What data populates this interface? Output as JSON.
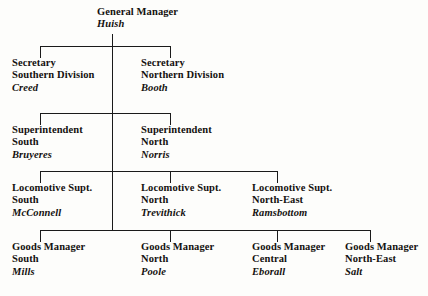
{
  "chart": {
    "line_color": "#1a1a1a",
    "background_color": "#fdfdfb",
    "text_color": "#14110f"
  },
  "nodes": {
    "general_manager": {
      "role": "General Manager",
      "region": "",
      "person": "Huish"
    },
    "secretary_south": {
      "role": "Secretary",
      "region": "Southern Division",
      "person": "Creed"
    },
    "secretary_north": {
      "role": "Secretary",
      "region": "Northern Division",
      "person": "Booth"
    },
    "superintendent_south": {
      "role": "Superintendent",
      "region": "South",
      "person": "Bruyeres"
    },
    "superintendent_north": {
      "role": "Superintendent",
      "region": "North",
      "person": "Norris"
    },
    "loco_supt_south": {
      "role": "Locomotive Supt.",
      "region": "South",
      "person": "McConnell"
    },
    "loco_supt_north": {
      "role": "Locomotive Supt.",
      "region": "North",
      "person": "Trevithick"
    },
    "loco_supt_north_east": {
      "role": "Locomotive Supt.",
      "region": "North-East",
      "person": "Ramsbottom"
    },
    "goods_manager_south": {
      "role": "Goods Manager",
      "region": "South",
      "person": "Mills"
    },
    "goods_manager_north": {
      "role": "Goods Manager",
      "region": "North",
      "person": "Poole"
    },
    "goods_manager_central": {
      "role": "Goods Manager",
      "region": "Central",
      "person": "Eborall"
    },
    "goods_manager_north_east": {
      "role": "Goods Manager",
      "region": "North-East",
      "person": "Salt"
    }
  }
}
